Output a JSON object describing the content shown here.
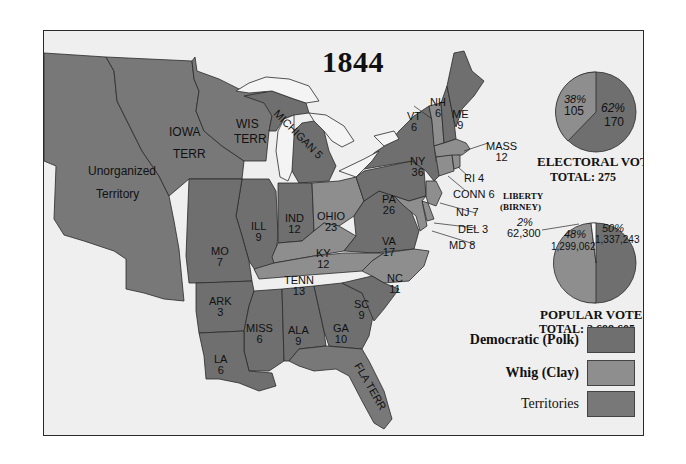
{
  "title": "1844",
  "colors": {
    "democratic": "#6f6f6f",
    "whig": "#8e8e8e",
    "territories": "#787878",
    "water": "#f4f4f4",
    "background": "#efefef",
    "border": "#2a2a2a"
  },
  "regions": {
    "unorganized": {
      "line1": "Unorganized",
      "line2": "Territory"
    },
    "iowa": {
      "line1": "IOWA",
      "line2": "TERR"
    },
    "wis": {
      "line1": "WIS",
      "line2": "TERR"
    },
    "michigan": {
      "label": "MICHIGAN 5"
    },
    "ill": {
      "name": "ILL",
      "votes": "9"
    },
    "ind": {
      "name": "IND",
      "votes": "12"
    },
    "ohio": {
      "name": "OHIO",
      "votes": "23"
    },
    "mo": {
      "name": "MO",
      "votes": "7"
    },
    "ky": {
      "name": "KY",
      "votes": "12"
    },
    "tenn": {
      "name": "TENN",
      "votes": "13"
    },
    "ark": {
      "name": "ARK",
      "votes": "3"
    },
    "miss": {
      "name": "MISS",
      "votes": "6"
    },
    "ala": {
      "name": "ALA",
      "votes": "9"
    },
    "ga": {
      "name": "GA",
      "votes": "10"
    },
    "la": {
      "name": "LA",
      "votes": "6"
    },
    "sc": {
      "name": "SC",
      "votes": "9"
    },
    "nc": {
      "name": "NC",
      "votes": "11"
    },
    "va": {
      "name": "VA",
      "votes": "17"
    },
    "pa": {
      "name": "PA",
      "votes": "26"
    },
    "ny": {
      "name": "NY",
      "votes": "36"
    },
    "vt": {
      "name": "VT",
      "votes": "6"
    },
    "nh": {
      "name": "NH",
      "votes": "6"
    },
    "me": {
      "name": "ME",
      "votes": "9"
    },
    "mass": {
      "name": "MASS",
      "votes": "12"
    },
    "ri": {
      "label": "RI 4"
    },
    "conn": {
      "label": "CONN 6"
    },
    "nj": {
      "label": "NJ 7"
    },
    "del": {
      "label": "DEL 3"
    },
    "md": {
      "label": "MD 8"
    },
    "fla": {
      "label": "FLA TERR"
    }
  },
  "electoral_vote": {
    "caption": "ELECTORAL VOTE",
    "total_label": "TOTAL: 275",
    "whig_pct": "38%",
    "whig_count": "105",
    "dem_pct": "62%",
    "dem_count": "170"
  },
  "popular_vote": {
    "caption": "POPULAR VOTE",
    "total_label": "TOTAL: 2,698,605",
    "liberty_line1": "LIBERTY",
    "liberty_line2": "(BIRNEY)",
    "liberty_pct": "2%",
    "liberty_count": "62,300",
    "whig_pct": "48%",
    "whig_count": "1,299,062",
    "dem_pct": "50%",
    "dem_count": "1,337,243"
  },
  "legend": [
    {
      "label": "Democratic (Polk)",
      "key": "democratic"
    },
    {
      "label": "Whig (Clay)",
      "key": "whig"
    },
    {
      "label": "Territories",
      "key": "territories"
    }
  ]
}
